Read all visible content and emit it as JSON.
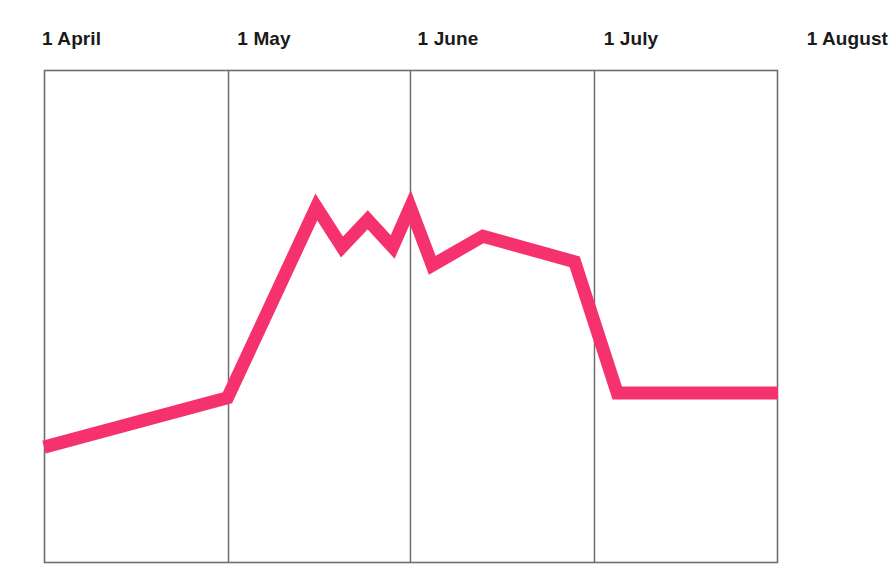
{
  "chart_data": {
    "type": "line",
    "title": "",
    "xlabel": "",
    "ylabel": "",
    "grid": true,
    "legend": null,
    "legend_position": "none",
    "axis_tick_labels": [
      "1 April",
      "1 May",
      "1 June",
      "1 July",
      "1 August"
    ],
    "axis_tick_dates": [
      "1 April",
      "1 May",
      "1 June",
      "1 July",
      "1 August"
    ],
    "xlim": [
      "1 April",
      "1 August"
    ],
    "ylim": [
      0,
      100
    ],
    "y_axis_visible": false,
    "y_tick_labels": [],
    "series": [
      {
        "name": "value",
        "color": "#F5326D",
        "stroke_width": 13,
        "points": [
          {
            "date": "1 April",
            "x": 0.0,
            "y": 23.5
          },
          {
            "date": "5 May",
            "x": 25.0,
            "y": 33.5
          },
          {
            "date": "17 May",
            "x": 37.1,
            "y": 72.2
          },
          {
            "date": "21 May",
            "x": 40.6,
            "y": 64.1
          },
          {
            "date": "25 May",
            "x": 44.1,
            "y": 69.6
          },
          {
            "date": "29 May",
            "x": 47.5,
            "y": 64.1
          },
          {
            "date": "1 June",
            "x": 49.9,
            "y": 72.2
          },
          {
            "date": "5 June",
            "x": 52.9,
            "y": 60.4
          },
          {
            "date": "13 June",
            "x": 59.8,
            "y": 66.3
          },
          {
            "date": "28 June",
            "x": 72.3,
            "y": 61.1
          },
          {
            "date": "7 July",
            "x": 78.1,
            "y": 34.5
          },
          {
            "date": "1 August",
            "x": 100.0,
            "y": 34.5
          }
        ]
      }
    ]
  },
  "axis": {
    "ticks": [
      {
        "label": "1 April",
        "x_pct": 0.0,
        "align": "start"
      },
      {
        "label": "1 May",
        "x_pct": 25.07,
        "align": "mid"
      },
      {
        "label": "1 June",
        "x_pct": 49.86,
        "align": "mid"
      },
      {
        "label": "1 July",
        "x_pct": 74.93,
        "align": "mid"
      },
      {
        "label": "1 August",
        "x_pct": 100.0,
        "align": "end"
      }
    ]
  },
  "colors": {
    "line": "#F5326D",
    "frame": "#6e6e6e",
    "gridline": "#6e6e6e",
    "background": "#ffffff",
    "label_text": "#1a1a1a"
  },
  "plot_box": {
    "left": 44,
    "top": 70,
    "right": 778,
    "bottom": 563
  }
}
